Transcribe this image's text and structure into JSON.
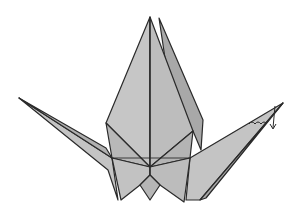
{
  "figure": {
    "width": 299,
    "height": 215,
    "colors": {
      "paper": "#bdbdbd",
      "paper_light": "#c9c9c9",
      "paper_dark": "#a8a8a8",
      "line": "#2a2a2a",
      "background": "#ffffff"
    },
    "annotations": [
      {
        "type": "fold-arrow",
        "description": "curved arrow at right wing tip indicating inside-reverse fold downward"
      }
    ]
  }
}
